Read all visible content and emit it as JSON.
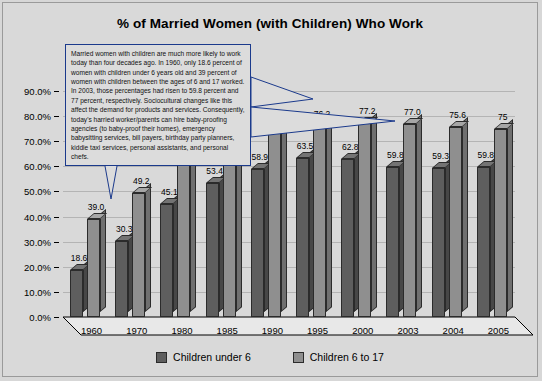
{
  "chart_data": {
    "type": "bar",
    "title": "% of Married Women (with Children) Who Work",
    "xlabel": "",
    "ylabel": "",
    "ylim": [
      0,
      90
    ],
    "ytick_labels": [
      "0.0%",
      "10.0%",
      "20.0%",
      "30.0%",
      "40.0%",
      "50.0%",
      "60.0%",
      "70.0%",
      "80.0%",
      "90.0%"
    ],
    "ytick_values": [
      0,
      10,
      20,
      30,
      40,
      50,
      60,
      70,
      80,
      90
    ],
    "grid": true,
    "legend_position": "bottom",
    "categories": [
      "1960",
      "1970",
      "1980",
      "1985",
      "1990",
      "1995",
      "2000",
      "2003",
      "2004",
      "2005"
    ],
    "series": [
      {
        "name": "Children under 6",
        "color": "#5e5e5e",
        "values": [
          18.6,
          30.3,
          45.1,
          53.4,
          58.9,
          63.5,
          62.8,
          59.8,
          59.3,
          59.8
        ],
        "labels": [
          "18.6",
          "30.3",
          "45.1",
          "53.4",
          "58.9",
          "63.5",
          "62.8",
          "59.8",
          "59.3",
          "59.8"
        ]
      },
      {
        "name": "Children 6 to 17",
        "color": "#8f8f8f",
        "values": [
          39.0,
          49.2,
          62.0,
          68.0,
          73.6,
          76.2,
          77.2,
          77.0,
          75.6,
          75
        ],
        "labels": [
          "39.0",
          "49.2",
          "62.0",
          "68.0",
          "73.6",
          "76.2",
          "77.2",
          "77.0",
          "75.6",
          "75"
        ]
      }
    ],
    "annotations": [
      {
        "name": "callout-note",
        "text": "Married women with children are much more likely to work today than four decades ago. In 1960, only 18.6 percent of women with children under 6 years old and 39 percent of women with children between the ages of 6 and 17 worked. In 2003, those percentages had risen to 59.8 percent and 77 percent, respectively. Sociocultural changes like this affect the demand for products and services. Consequently, today's harried worker/parents can hire baby-proofing agencies (to baby-proof their homes), emergency babysitting services, bill payers, birthday party planners, kiddie taxi services, personal assistants, and personal chefs.",
        "points_to": [
          "1960 Children 6 to 17",
          "2003 Children under 6",
          "2003 Children 6 to 17"
        ]
      }
    ]
  },
  "colors": {
    "background": "#d9d9d9",
    "series0": "#5e5e5e",
    "series1": "#8f8f8f",
    "callout_border": "#1b3a8c",
    "gridline": "#b4b4b4",
    "axis": "#000000"
  }
}
